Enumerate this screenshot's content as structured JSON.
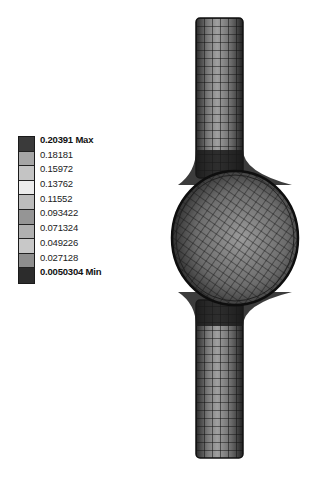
{
  "legend": {
    "max_label": "0.20391 Max",
    "levels": [
      "0.18181",
      "0.15972",
      "0.13762",
      "0.11552",
      "0.093422",
      "0.071324",
      "0.049226",
      "0.027128"
    ],
    "min_label": "0.0050304 Min",
    "swatch_colors": [
      "#3a3a3a",
      "#a6a6a6",
      "#c4c4c4",
      "#ebebeb",
      "#bcbcbc",
      "#959595",
      "#b0b0b0",
      "#c8c8c8",
      "#8e8e8e",
      "#2c2c2c"
    ]
  },
  "model": {
    "description": "Meshed tube with central spherical bulb (FEA contour result)",
    "tube_color": "#6e6e6e",
    "sphere_color": "#7a7a7a",
    "mesh_color": "#111111"
  }
}
